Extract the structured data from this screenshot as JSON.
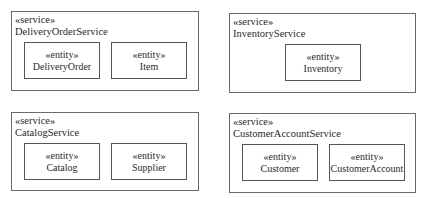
{
  "diagram": {
    "services": [
      {
        "stereotype": "«service»",
        "name": "DeliveryOrderService",
        "entities": [
          {
            "stereotype": "«entity»",
            "name": "DeliveryOrder"
          },
          {
            "stereotype": "«entity»",
            "name": "Item"
          }
        ]
      },
      {
        "stereotype": "«service»",
        "name": "InventoryService",
        "entities": [
          {
            "stereotype": "«entity»",
            "name": "Inventory"
          }
        ]
      },
      {
        "stereotype": "«service»",
        "name": "CatalogService",
        "entities": [
          {
            "stereotype": "«entity»",
            "name": "Catalog"
          },
          {
            "stereotype": "«entity»",
            "name": "Supplier"
          }
        ]
      },
      {
        "stereotype": "«service»",
        "name": "CustomerAccountService",
        "entities": [
          {
            "stereotype": "«entity»",
            "name": "Customer"
          },
          {
            "stereotype": "«entity»",
            "name": "CustomerAccount"
          }
        ]
      }
    ]
  },
  "colors": {
    "border": "#6a6a6a",
    "text": "#2a2a2a",
    "background": "#ffffff"
  }
}
